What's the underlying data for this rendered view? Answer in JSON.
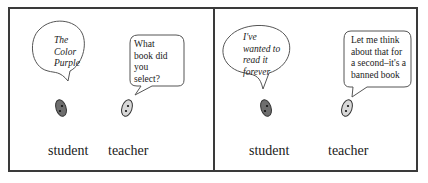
{
  "panels": [
    {
      "student": {
        "speech": [
          "The",
          "Color",
          "Purple"
        ],
        "label": "student",
        "speech_style": "italic"
      },
      "teacher": {
        "speech": [
          "What",
          "book did",
          "you",
          "select?"
        ],
        "label": "teacher",
        "speech_style": "regular"
      }
    },
    {
      "student": {
        "speech": [
          "I've",
          "wanted to",
          "read it",
          "forever"
        ],
        "label": "student",
        "speech_style": "italic"
      },
      "teacher": {
        "speech": [
          "Let me think",
          "about that for",
          "a second–it's a",
          "banned book"
        ],
        "label": "teacher",
        "speech_style": "regular"
      }
    }
  ],
  "colors": {
    "border": "#3a3a3a",
    "student_face": "#6e6e6e",
    "teacher_face": "#d8d8d8"
  }
}
